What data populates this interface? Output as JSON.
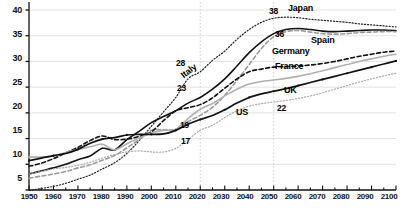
{
  "chart_data": {
    "type": "line",
    "title": "",
    "subtitle": "",
    "xlabel": "",
    "ylabel": "",
    "xlim": [
      1950,
      2100
    ],
    "ylim": [
      5,
      41
    ],
    "yticks": [
      5,
      10,
      15,
      20,
      25,
      30,
      35,
      40
    ],
    "xticks": [
      1950,
      1960,
      1970,
      1980,
      1990,
      2000,
      2010,
      2020,
      2030,
      2040,
      2050,
      2060,
      2070,
      2080,
      2090,
      2100
    ],
    "minor_xtick_step": 5,
    "grid": "horizontal",
    "legend": "inline-labels",
    "reference_lines": [
      2020,
      2050
    ],
    "x": [
      1950,
      1955,
      1960,
      1965,
      1970,
      1975,
      1980,
      1985,
      1990,
      1995,
      2000,
      2005,
      2010,
      2015,
      2020,
      2025,
      2030,
      2035,
      2040,
      2045,
      2050,
      2055,
      2060,
      2065,
      2070,
      2075,
      2080,
      2085,
      2090,
      2095,
      2100
    ],
    "series": [
      {
        "name": "Japan",
        "style": "dotted",
        "color": "#222222",
        "values": [
          4.9,
          5.3,
          5.7,
          6.3,
          7.1,
          7.9,
          9.1,
          10.3,
          12.1,
          14.6,
          17.4,
          20.2,
          23.0,
          26.6,
          28.0,
          30.2,
          32.0,
          34.3,
          36.2,
          37.6,
          38.4,
          38.6,
          38.5,
          38.2,
          38.0,
          37.8,
          37.6,
          37.3,
          37.1,
          36.9,
          36.7
        ]
      },
      {
        "name": "Italy",
        "style": "solid",
        "color": "#111111",
        "values": [
          8.1,
          8.7,
          9.3,
          10.0,
          10.9,
          11.6,
          13.1,
          12.8,
          14.8,
          16.4,
          18.1,
          19.3,
          20.4,
          21.9,
          23.0,
          24.6,
          26.6,
          29.1,
          31.7,
          33.8,
          35.4,
          36.2,
          36.4,
          36.2,
          35.9,
          35.8,
          35.9,
          36.0,
          36.1,
          36.1,
          36.0
        ]
      },
      {
        "name": "Spain",
        "style": "dashed",
        "color": "#9a9a9a",
        "values": [
          7.3,
          7.7,
          8.1,
          8.6,
          9.3,
          9.9,
          10.8,
          11.7,
          13.2,
          14.8,
          16.6,
          16.7,
          16.8,
          18.3,
          19.5,
          21.1,
          23.4,
          26.3,
          29.4,
          32.5,
          34.8,
          35.8,
          36.0,
          35.7,
          35.4,
          35.3,
          35.4,
          35.6,
          35.7,
          35.8,
          35.8
        ]
      },
      {
        "name": "Germany",
        "style": "dashed",
        "color": "#111111",
        "values": [
          9.6,
          10.2,
          11.1,
          12.2,
          13.3,
          14.6,
          15.5,
          14.8,
          14.9,
          15.4,
          16.3,
          18.5,
          20.4,
          21.0,
          21.6,
          22.9,
          24.8,
          26.6,
          28.0,
          28.5,
          28.9,
          29.0,
          29.1,
          29.3,
          29.6,
          30.0,
          30.5,
          31.0,
          31.4,
          31.8,
          32.0
        ]
      },
      {
        "name": "France",
        "style": "solid",
        "color": "#b0b0b0",
        "values": [
          11.4,
          11.4,
          11.6,
          12.3,
          12.9,
          13.4,
          13.9,
          12.8,
          14.0,
          15.1,
          16.1,
          16.6,
          16.8,
          18.9,
          20.7,
          21.8,
          23.3,
          24.6,
          25.6,
          26.1,
          26.4,
          26.7,
          27.1,
          27.6,
          28.2,
          28.8,
          29.4,
          30.0,
          30.5,
          31.0,
          31.4
        ]
      },
      {
        "name": "UK",
        "style": "solid-marker",
        "color": "#111111",
        "values": [
          10.7,
          11.2,
          11.7,
          12.1,
          12.9,
          14.1,
          14.9,
          15.2,
          15.7,
          15.8,
          15.8,
          15.9,
          16.6,
          17.8,
          18.7,
          19.5,
          20.6,
          21.9,
          23.0,
          23.7,
          24.2,
          24.7,
          25.3,
          25.9,
          26.5,
          27.1,
          27.7,
          28.3,
          28.9,
          29.5,
          30.1
        ]
      },
      {
        "name": "US",
        "style": "dotted",
        "color": "#aaaaaa",
        "values": [
          8.1,
          8.6,
          9.1,
          9.4,
          9.8,
          10.4,
          11.2,
          11.9,
          12.4,
          12.6,
          12.4,
          12.4,
          13.1,
          14.8,
          16.6,
          17.6,
          19.1,
          20.4,
          21.3,
          21.8,
          22.1,
          22.4,
          22.8,
          23.3,
          23.9,
          24.6,
          25.3,
          26.0,
          26.6,
          27.2,
          27.7
        ]
      }
    ],
    "value_annotations": [
      {
        "text": "38",
        "series": "Japan",
        "x": 2050,
        "value": 38
      },
      {
        "text": "36",
        "series": "Italy",
        "x": 2050,
        "value": 36
      },
      {
        "text": "28",
        "series": "Japan",
        "x": 2020,
        "value": 28
      },
      {
        "text": "23",
        "series": "Italy",
        "x": 2020,
        "value": 23
      },
      {
        "text": "19",
        "series": "Germany",
        "x": 2020,
        "value": 19
      },
      {
        "text": "17",
        "series": "US",
        "x": 2020,
        "value": 17
      },
      {
        "text": "22",
        "series": "US",
        "x": 2050,
        "value": 22
      }
    ],
    "series_labels": [
      {
        "text": "Japan",
        "series": "Japan"
      },
      {
        "text": "Spain",
        "series": "Spain"
      },
      {
        "text": "Germany",
        "series": "Germany"
      },
      {
        "text": "France",
        "series": "France"
      },
      {
        "text": "UK",
        "series": "UK"
      },
      {
        "text": "US",
        "series": "US"
      },
      {
        "text": "Italy",
        "series": "Italy"
      }
    ]
  },
  "axis": {
    "y_tick_labels": [
      "40",
      "35",
      "30",
      "25",
      "20",
      "15",
      "10",
      "5"
    ],
    "x_tick_labels": [
      "1950",
      "1960",
      "1970",
      "1980",
      "1990",
      "2000",
      "2010",
      "2020",
      "2030",
      "2040",
      "2050",
      "2060",
      "2070",
      "2080",
      "2090",
      "2100"
    ]
  },
  "annotations": {
    "a38": "38",
    "a36": "36",
    "a28": "28",
    "a23": "23",
    "a19": "19",
    "a17": "17",
    "a22": "22"
  },
  "labels": {
    "japan": "Japan",
    "spain": "Spain",
    "germany": "Germany",
    "france": "France",
    "uk": "UK",
    "us": "US",
    "italy": "Italy"
  },
  "colors": {
    "axis": "#111111",
    "grid": "#e2e2e2",
    "reference": "#cfcfcf",
    "japan": "#222222",
    "italy": "#111111",
    "spain": "#9a9a9a",
    "germany": "#111111",
    "france": "#b0b0b0",
    "uk": "#111111",
    "us": "#aaaaaa"
  }
}
